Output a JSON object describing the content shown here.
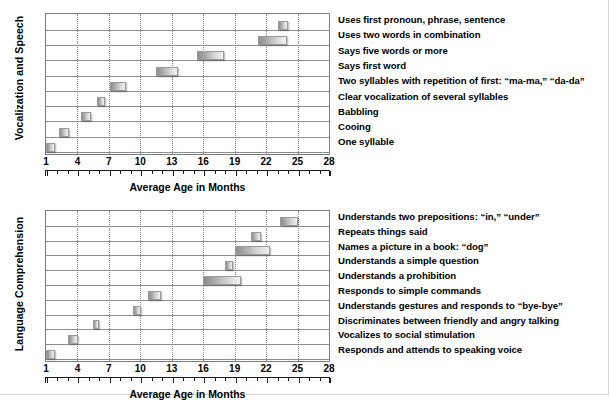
{
  "chart_data": [
    {
      "type": "bar",
      "orientation": "horizontal",
      "title": "Vocalization and Speech",
      "ylabel": "Vocalization and Speech",
      "xlabel": "Average Age in Months",
      "xlim": [
        1,
        28
      ],
      "xticks": [
        1,
        4,
        7,
        10,
        13,
        16,
        19,
        22,
        25,
        28
      ],
      "minor_tick_interval": 1,
      "grid": "vertical dotted at major ticks",
      "legend": "none",
      "categories": [
        "One syllable",
        "Cooing",
        "Babbling",
        "Clear vocalization of several syllables",
        "Two syllables with repetition of first: “ma-ma,” “da-da”",
        "Says first word",
        "Says five words or more",
        "Uses two words in combination",
        "Uses first pronoun, phrase, sentence"
      ],
      "bars": [
        {
          "label": "One syllable",
          "start": 1.0,
          "end": 1.9
        },
        {
          "label": "Cooing",
          "start": 2.2,
          "end": 3.2
        },
        {
          "label": "Babbling",
          "start": 4.3,
          "end": 5.3
        },
        {
          "label": "Clear vocalization of several syllables",
          "start": 5.9,
          "end": 6.6
        },
        {
          "label": "Two syllables with repetition of first: “ma-ma,” “da-da”",
          "start": 7.1,
          "end": 8.6
        },
        {
          "label": "Says first word",
          "start": 11.5,
          "end": 13.6
        },
        {
          "label": "Says five words or more",
          "start": 15.4,
          "end": 18.0
        },
        {
          "label": "Uses two words in combination",
          "start": 21.2,
          "end": 24.0
        },
        {
          "label": "Uses first pronoun, phrase, sentence",
          "start": 23.1,
          "end": 24.1
        }
      ]
    },
    {
      "type": "bar",
      "orientation": "horizontal",
      "title": "Language Comprehension",
      "ylabel": "Language Comprehension",
      "xlabel": "Average Age in Months",
      "xlim": [
        1,
        28
      ],
      "xticks": [
        1,
        4,
        7,
        10,
        13,
        16,
        19,
        22,
        25,
        28
      ],
      "minor_tick_interval": 1,
      "grid": "vertical dotted at major ticks",
      "legend": "none",
      "categories": [
        "Responds and attends to speaking voice",
        "Vocalizes to social stimulation",
        "Discriminates between friendly and angry talking",
        "Understands gestures and responds to “bye-bye”",
        "Responds to simple commands",
        "Understands a prohibition",
        "Understands a simple question",
        "Names a picture in a book: “dog”",
        "Repeats things said",
        "Understands two prepositions: “in,” “under”"
      ],
      "bars": [
        {
          "label": "Responds and attends to speaking voice",
          "start": 1.0,
          "end": 1.9
        },
        {
          "label": "Vocalizes to social stimulation",
          "start": 3.1,
          "end": 4.1
        },
        {
          "label": "Discriminates between friendly and angry talking",
          "start": 5.5,
          "end": 6.1
        },
        {
          "label": "Understands gestures and responds to “bye-bye”",
          "start": 9.3,
          "end": 10.1
        },
        {
          "label": "Responds to simple commands",
          "start": 10.7,
          "end": 12.0
        },
        {
          "label": "Understands a prohibition",
          "start": 16.0,
          "end": 19.6
        },
        {
          "label": "Understands a simple question",
          "start": 18.1,
          "end": 18.8
        },
        {
          "label": "Names a picture in a book: “dog”",
          "start": 19.0,
          "end": 22.4
        },
        {
          "label": "Repeats things said",
          "start": 20.6,
          "end": 21.5
        },
        {
          "label": "Understands two prepositions: “in,” “under”",
          "start": 23.3,
          "end": 25.0
        }
      ]
    }
  ],
  "panels": [
    {
      "id": "vocalization-and-speech",
      "y_axis_title": "Vocalization and Speech",
      "x_axis_title": "Average Age in Months",
      "x_tick_labels": [
        "1",
        "4",
        "7",
        "10",
        "13",
        "16",
        "19",
        "22",
        "25",
        "28"
      ],
      "milestones": [
        "Uses first pronoun, phrase, sentence",
        "Uses two words in combination",
        "Says five words or more",
        "Says first word",
        "Two syllables with repetition of first: “ma-ma,” “da-da”",
        "Clear vocalization of several syllables",
        "Babbling",
        "Cooing",
        "One syllable"
      ]
    },
    {
      "id": "language-comprehension",
      "y_axis_title": "Language Comprehension",
      "x_axis_title": "Average Age in Months",
      "x_tick_labels": [
        "1",
        "4",
        "7",
        "10",
        "13",
        "16",
        "19",
        "22",
        "25",
        "28"
      ],
      "milestones": [
        "Understands two prepositions: “in,” “under”",
        "Repeats things said",
        "Names a picture in a book: “dog”",
        "Understands a simple question",
        "Understands a prohibition",
        "Responds to simple commands",
        "Understands gestures and responds to “bye-bye”",
        "Discriminates between friendly and angry talking",
        "Vocalizes to social stimulation",
        "Responds and attends to speaking voice"
      ]
    }
  ],
  "colors": {
    "bar_dark": "#8e8e8e",
    "bar_light": "#f2f2f2",
    "bar_border": "#9a9a9a",
    "plot_border": "#7c7c7c",
    "gridline": "#8a8a8a",
    "rowline": "#8e8e8e",
    "text": "#000000",
    "background": "#ffffff"
  }
}
